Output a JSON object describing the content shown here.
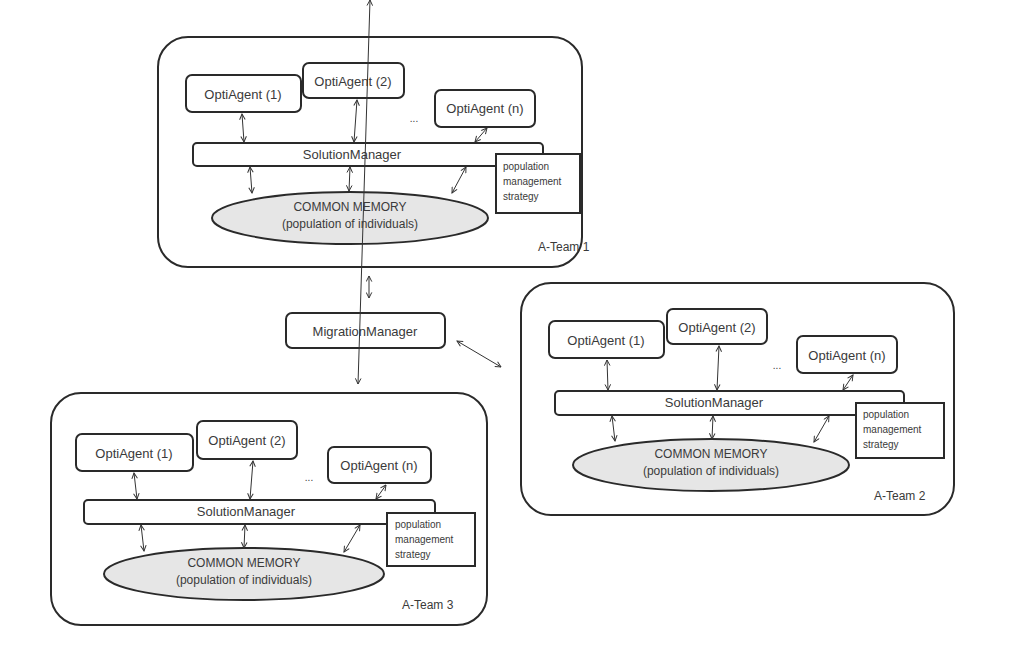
{
  "diagram": {
    "migration_manager": {
      "label": "MigrationManager"
    },
    "teams": [
      {
        "name": "A-Team 1",
        "agents": [
          "OptiAgent (1)",
          "OptiAgent (2)",
          "OptiAgent (n)"
        ],
        "ellipsis": "...",
        "solution_manager": "SolutionManager",
        "strategy": [
          "population",
          "management",
          "strategy"
        ],
        "memory": [
          "COMMON MEMORY",
          "(population of individuals)"
        ]
      },
      {
        "name": "A-Team 2",
        "agents": [
          "OptiAgent (1)",
          "OptiAgent (2)",
          "OptiAgent (n)"
        ],
        "ellipsis": "...",
        "solution_manager": "SolutionManager",
        "strategy": [
          "population",
          "management",
          "strategy"
        ],
        "memory": [
          "COMMON MEMORY",
          "(population of individuals)"
        ]
      },
      {
        "name": "A-Team 3",
        "agents": [
          "OptiAgent (1)",
          "OptiAgent (2)",
          "OptiAgent (n)"
        ],
        "ellipsis": "...",
        "solution_manager": "SolutionManager",
        "strategy": [
          "population",
          "management",
          "strategy"
        ],
        "memory": [
          "COMMON MEMORY",
          "(population of individuals)"
        ]
      }
    ],
    "colors": {
      "stroke": "#2a2a2a",
      "memory_fill": "#e6e6e6",
      "text": "#3a3a3a"
    }
  }
}
